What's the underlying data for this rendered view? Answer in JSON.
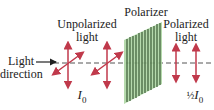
{
  "labels": {
    "unpolarized_line1": "Unpolarized",
    "unpolarized_line2": "light",
    "polarizer": "Polarizer",
    "polarized_line1": "Polarized",
    "polarized_line2": "light",
    "direction_line1": "Light",
    "direction_line2": "direction",
    "intensity_in_symbol": "I",
    "intensity_in_sub": "0",
    "intensity_out_frac": "½",
    "intensity_out_symbol": "I",
    "intensity_out_sub": "0"
  },
  "colors": {
    "arrow": "#c0394b",
    "polarizer_fill": "#a9d39f",
    "polarizer_lines": "#2f4f2a",
    "axis": "#555555",
    "text": "#222222"
  }
}
